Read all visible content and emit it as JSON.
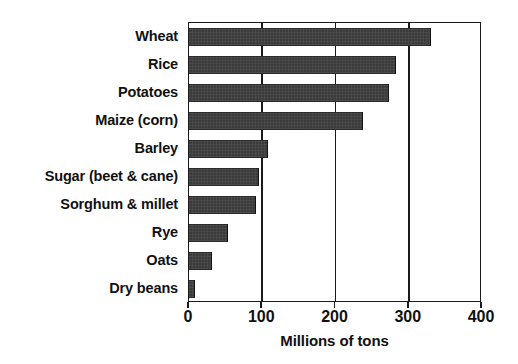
{
  "chart_data": {
    "type": "bar",
    "orientation": "horizontal",
    "title": "",
    "xlabel": "Millions of tons",
    "ylabel": "",
    "xlim": [
      0,
      400
    ],
    "xticks": [
      0,
      100,
      200,
      300,
      400
    ],
    "grid": true,
    "legend": null,
    "categories": [
      "Wheat",
      "Rice",
      "Potatoes",
      "Maize (corn)",
      "Barley",
      "Sugar (beet & cane)",
      "Sorghum & millet",
      "Rye",
      "Oats",
      "Dry beans"
    ],
    "values": [
      330,
      283,
      273,
      238,
      108,
      96,
      92,
      53,
      32,
      8
    ],
    "bar_color": "#3b3b3b",
    "axis_color": "#1a1a1a"
  },
  "axis": {
    "title": "Millions of tons",
    "tick_labels": [
      "0",
      "100",
      "200",
      "300",
      "400"
    ]
  }
}
